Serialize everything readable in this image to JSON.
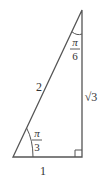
{
  "diagram": {
    "type": "right-triangle",
    "stroke_color": "#555555",
    "text_color": "#333333",
    "sides": {
      "hypotenuse": "2",
      "adjacent": "1",
      "opposite": "√3"
    },
    "angles": {
      "top": {
        "numerator": "π",
        "denominator": "6"
      },
      "bottom_left": {
        "numerator": "π",
        "denominator": "3"
      },
      "bottom_right": "right-angle"
    }
  }
}
